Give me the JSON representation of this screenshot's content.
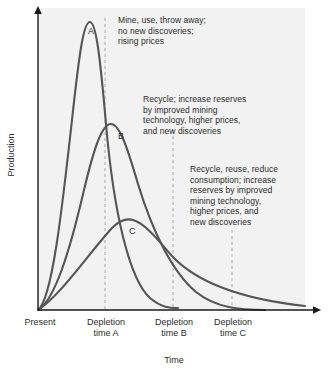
{
  "chart_data": {
    "type": "line",
    "title": "",
    "xlabel": "Time",
    "ylabel": "Production",
    "grid": false,
    "legend": "none",
    "background": "#f2f2f2",
    "curve_color": "#555555",
    "axis_color": "#1a1a1a",
    "guide_color": "#b3b3b3",
    "x_ticks": [
      "Present",
      "Depletion\ntime A",
      "Depletion\ntime B",
      "Depletion\ntime C"
    ],
    "x_tick_positions": [
      38,
      105,
      173,
      232
    ],
    "y_ticks": [],
    "xlim": [
      0,
      1
    ],
    "ylim": [
      0,
      1
    ],
    "series": [
      {
        "name": "A",
        "label": "A",
        "peak_x": 0.24,
        "peak_y": 1.0,
        "end_x": 0.49,
        "description": "Mine, use, throw away; no new discoveries; rising prices",
        "path": "M 38 310 C 52 300 62 210 72 120 C 80 46 84 22 90 22 C 96 22 100 56 106 124 C 114 216 130 280 150 298 C 162 308 170 308 178 308"
      },
      {
        "name": "B",
        "label": "B",
        "peak_x": 0.3,
        "peak_y": 0.65,
        "end_x": 0.82,
        "description": "Recycle; increase reserves by improved mining technology, higher prices, and new discoveries",
        "path": "M 38 310 C 55 300 70 250 84 190 C 94 148 102 124 111 124 C 120 124 128 150 138 184 C 152 230 172 272 196 292 C 216 308 240 310 265 310"
      },
      {
        "name": "C",
        "label": "C",
        "peak_x": 0.38,
        "peak_y": 0.37,
        "end_x": 1.0,
        "description": "Recycle, reuse, reduce consumption; increase reserves by improved mining technology, higher prices, and new discoveries",
        "path": "M 38 310 C 60 296 90 252 112 228 C 120 220 126 218 133 220 C 146 224 158 240 172 256 C 200 286 250 300 305 306"
      }
    ],
    "annotations": [
      {
        "id": "a",
        "text": "Mine, use, throw away;\nno new discoveries;\nrising prices",
        "lines": [
          "Mine, use, throw away;",
          "no new discoveries;",
          "rising prices"
        ]
      },
      {
        "id": "b",
        "text": "Recycle; increase reserves\nby improved mining\ntechnology, higher prices,\nand new discoveries",
        "lines": [
          "Recycle; increase reserves",
          "by improved mining",
          "technology, higher prices,",
          "and new discoveries"
        ]
      },
      {
        "id": "c",
        "text": "Recycle, reuse, reduce\nconsumption; increase\nreserves by improved\nmining technology,\nhigher prices, and\nnew discoveries",
        "lines": [
          "Recycle, reuse, reduce",
          "consumption; increase",
          "reserves by improved",
          "mining technology,",
          "higher prices, and",
          "new discoveries"
        ]
      }
    ],
    "guide_lines": [
      {
        "label": "Depletion time A",
        "x": 105
      },
      {
        "label": "Depletion time B",
        "x": 173
      },
      {
        "label": "Depletion time C",
        "x": 232
      }
    ]
  }
}
